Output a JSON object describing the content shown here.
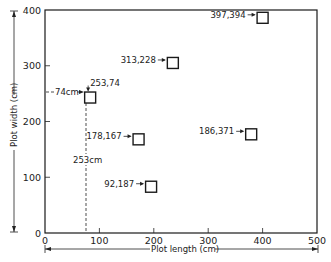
{
  "chart_data": {
    "type": "scatter",
    "title": "",
    "xlabel": "Plot length (cm)",
    "ylabel": "Plot width (cm)",
    "xlim": [
      0,
      500
    ],
    "ylim": [
      0,
      400
    ],
    "xticks": [
      "0",
      "100",
      "200",
      "300",
      "400",
      "500"
    ],
    "yticks": [
      "0",
      "100",
      "200",
      "300",
      "400"
    ],
    "grid": false,
    "legend": null,
    "marker": "open-square",
    "points": [
      {
        "label": "397,394",
        "x": 400,
        "y": 386
      },
      {
        "label": "313,228",
        "x": 235,
        "y": 305
      },
      {
        "label": "253,74",
        "x": 83,
        "y": 243
      },
      {
        "label": "178,167",
        "x": 172,
        "y": 168
      },
      {
        "label": "186,371",
        "x": 379,
        "y": 177
      },
      {
        "label": "92,187",
        "x": 195,
        "y": 83
      }
    ],
    "annotations": [
      {
        "text": "74cm",
        "type": "horizontal-dashed-arrow",
        "y": 253
      },
      {
        "text": "253cm",
        "type": "vertical-dashed-line",
        "x": 74
      }
    ]
  }
}
